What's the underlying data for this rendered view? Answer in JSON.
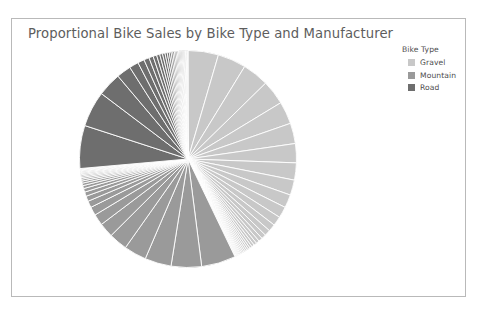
{
  "chart": {
    "title": "Proportional Bike Sales by Bike Type and Manufacturer",
    "frame_border_color": "#b9b9b9",
    "background": "#ffffff",
    "title_color": "#5d5d5d"
  },
  "legend": {
    "title": "Bike Type",
    "position": "top-right",
    "items": [
      {
        "label": "Gravel",
        "color": "#c8c8c8"
      },
      {
        "label": "Mountain",
        "color": "#9a9a9a"
      },
      {
        "label": "Road",
        "color": "#6e6e6e"
      }
    ]
  },
  "caption_fragment": "",
  "chart_data": {
    "type": "pie",
    "title": "Proportional Bike Sales by Bike Type and Manufacturer",
    "xlabel": "",
    "ylabel": "",
    "legend_title": "Bike Type",
    "legend_position": "top-right",
    "grid": false,
    "start_angle_deg": 0,
    "direction": "clockwise",
    "separator_color": "#ffffff",
    "note": "Each ring segment is one manufacturer; segments are grouped and colored by bike type. Values are proportional shares (percent of total sales) estimated from segment arc widths.",
    "groups": [
      {
        "name": "Gravel",
        "color": "#c8c8c8",
        "total_percent": 43.0,
        "start_deg": 0.0,
        "end_deg": 154.8,
        "slices": [
          {
            "manufacturer": "Gravel 1",
            "value": 4.6
          },
          {
            "manufacturer": "Gravel 2",
            "value": 4.3
          },
          {
            "manufacturer": "Gravel 3",
            "value": 4.0
          },
          {
            "manufacturer": "Gravel 4",
            "value": 3.7
          },
          {
            "manufacturer": "Gravel 5",
            "value": 3.4
          },
          {
            "manufacturer": "Gravel 6",
            "value": 3.1
          },
          {
            "manufacturer": "Gravel 7",
            "value": 2.9
          },
          {
            "manufacturer": "Gravel 8",
            "value": 2.6
          },
          {
            "manufacturer": "Gravel 9",
            "value": 2.3
          },
          {
            "manufacturer": "Gravel 10",
            "value": 2.0
          },
          {
            "manufacturer": "Gravel 11",
            "value": 1.7
          },
          {
            "manufacturer": "Gravel 12",
            "value": 1.4
          },
          {
            "manufacturer": "Gravel 13",
            "value": 1.1
          },
          {
            "manufacturer": "Gravel 14",
            "value": 0.9
          },
          {
            "manufacturer": "Gravel 15",
            "value": 0.7
          },
          {
            "manufacturer": "Gravel 16",
            "value": 0.6
          },
          {
            "manufacturer": "Gravel 17",
            "value": 0.5
          },
          {
            "manufacturer": "Gravel 18",
            "value": 0.45
          },
          {
            "manufacturer": "Gravel 19",
            "value": 0.4
          },
          {
            "manufacturer": "Gravel 20",
            "value": 0.35
          },
          {
            "manufacturer": "Gravel 21",
            "value": 0.3
          },
          {
            "manufacturer": "Gravel 22",
            "value": 0.28
          },
          {
            "manufacturer": "Gravel 23",
            "value": 0.26
          },
          {
            "manufacturer": "Gravel 24",
            "value": 0.24
          },
          {
            "manufacturer": "Gravel 25",
            "value": 0.22
          },
          {
            "manufacturer": "Gravel 26",
            "value": 0.2
          },
          {
            "manufacturer": "Gravel 27",
            "value": 0.18
          },
          {
            "manufacturer": "Gravel 28",
            "value": 0.16
          },
          {
            "manufacturer": "Gravel 29",
            "value": 0.15
          },
          {
            "manufacturer": "Gravel 30",
            "value": 0.14
          },
          {
            "manufacturer": "Gravel 31",
            "value": 0.13
          },
          {
            "manufacturer": "Gravel 32",
            "value": 0.12
          },
          {
            "manufacturer": "Gravel 33",
            "value": 0.11
          },
          {
            "manufacturer": "Gravel 34",
            "value": 0.1
          }
        ]
      },
      {
        "name": "Mountain",
        "color": "#9a9a9a",
        "total_percent": 31.0,
        "start_deg": 154.8,
        "end_deg": 266.4,
        "slices": [
          {
            "manufacturer": "Mountain 1",
            "value": 5.2
          },
          {
            "manufacturer": "Mountain 2",
            "value": 4.6
          },
          {
            "manufacturer": "Mountain 3",
            "value": 4.0
          },
          {
            "manufacturer": "Mountain 4",
            "value": 3.4
          },
          {
            "manufacturer": "Mountain 5",
            "value": 2.8
          },
          {
            "manufacturer": "Mountain 6",
            "value": 2.2
          },
          {
            "manufacturer": "Mountain 7",
            "value": 1.7
          },
          {
            "manufacturer": "Mountain 8",
            "value": 1.3
          },
          {
            "manufacturer": "Mountain 9",
            "value": 1.0
          },
          {
            "manufacturer": "Mountain 10",
            "value": 0.8
          },
          {
            "manufacturer": "Mountain 11",
            "value": 0.65
          },
          {
            "manufacturer": "Mountain 12",
            "value": 0.55
          },
          {
            "manufacturer": "Mountain 13",
            "value": 0.45
          },
          {
            "manufacturer": "Mountain 14",
            "value": 0.38
          },
          {
            "manufacturer": "Mountain 15",
            "value": 0.32
          },
          {
            "manufacturer": "Mountain 16",
            "value": 0.28
          },
          {
            "manufacturer": "Mountain 17",
            "value": 0.25
          },
          {
            "manufacturer": "Mountain 18",
            "value": 0.22
          },
          {
            "manufacturer": "Mountain 19",
            "value": 0.2
          },
          {
            "manufacturer": "Mountain 20",
            "value": 0.18
          },
          {
            "manufacturer": "Mountain 21",
            "value": 0.16
          },
          {
            "manufacturer": "Mountain 22",
            "value": 0.14
          },
          {
            "manufacturer": "Mountain 23",
            "value": 0.13
          },
          {
            "manufacturer": "Mountain 24",
            "value": 0.12
          },
          {
            "manufacturer": "Mountain 25",
            "value": 0.11
          },
          {
            "manufacturer": "Mountain 26",
            "value": 0.1
          }
        ]
      },
      {
        "name": "Road",
        "color": "#6e6e6e",
        "total_percent": 26.0,
        "start_deg": 266.4,
        "end_deg": 360.0,
        "slices": [
          {
            "manufacturer": "Road 1",
            "value": 6.5
          },
          {
            "manufacturer": "Road 2",
            "value": 5.4
          },
          {
            "manufacturer": "Road 3",
            "value": 3.6
          },
          {
            "manufacturer": "Road 4",
            "value": 2.2
          },
          {
            "manufacturer": "Road 5",
            "value": 1.4
          },
          {
            "manufacturer": "Road 6",
            "value": 1.0
          },
          {
            "manufacturer": "Road 7",
            "value": 0.8
          },
          {
            "manufacturer": "Road 8",
            "value": 0.65
          },
          {
            "manufacturer": "Road 9",
            "value": 0.55
          },
          {
            "manufacturer": "Road 10",
            "value": 0.48
          },
          {
            "manufacturer": "Road 11",
            "value": 0.42
          },
          {
            "manufacturer": "Road 12",
            "value": 0.38
          },
          {
            "manufacturer": "Road 13",
            "value": 0.34
          },
          {
            "manufacturer": "Road 14",
            "value": 0.31
          },
          {
            "manufacturer": "Road 15",
            "value": 0.28
          },
          {
            "manufacturer": "Road 16",
            "value": 0.26
          },
          {
            "manufacturer": "Road 17",
            "value": 0.24
          },
          {
            "manufacturer": "Road 18",
            "value": 0.22
          },
          {
            "manufacturer": "Road 19",
            "value": 0.2
          },
          {
            "manufacturer": "Road 20",
            "value": 0.19
          },
          {
            "manufacturer": "Road 21",
            "value": 0.18
          },
          {
            "manufacturer": "Road 22",
            "value": 0.17
          },
          {
            "manufacturer": "Road 23",
            "value": 0.16
          },
          {
            "manufacturer": "Road 24",
            "value": 0.15
          },
          {
            "manufacturer": "Road 25",
            "value": 0.14
          },
          {
            "manufacturer": "Road 26",
            "value": 0.13
          },
          {
            "manufacturer": "Road 27",
            "value": 0.12
          },
          {
            "manufacturer": "Road 28",
            "value": 0.11
          },
          {
            "manufacturer": "Road 29",
            "value": 0.1
          },
          {
            "manufacturer": "Road 30",
            "value": 0.09
          },
          {
            "manufacturer": "Road 31",
            "value": 0.08
          }
        ]
      }
    ]
  }
}
